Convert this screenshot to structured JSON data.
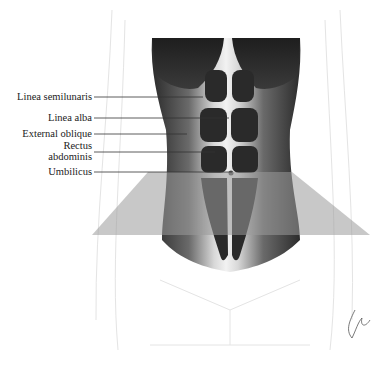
{
  "figure": {
    "labels": [
      {
        "text": "Linea semilunaris",
        "line_start": [
          94,
          97
        ],
        "line_end": [
          203,
          97
        ]
      },
      {
        "text": "Linea alba",
        "line_start": [
          94,
          118
        ],
        "line_end": [
          229,
          118
        ]
      },
      {
        "text": "External oblique",
        "line_start": [
          94,
          134
        ],
        "line_end": [
          187,
          134
        ]
      },
      {
        "text": "Rectus\nabdominis",
        "line_start": [
          94,
          152
        ],
        "line_end": [
          215,
          152
        ]
      },
      {
        "text": "Umbilicus",
        "line_start": [
          94,
          172
        ],
        "line_end": [
          232,
          172
        ]
      }
    ],
    "colors": {
      "muscle_dark": "#2a2a2a",
      "muscle_mid": "#5a5a5a",
      "skin_highlight": "#e8e8e8",
      "overlay_gray": "#bdbdbd",
      "outline": "#e2e2e2",
      "label_line": "#333333"
    },
    "signature": "artist-signature"
  }
}
